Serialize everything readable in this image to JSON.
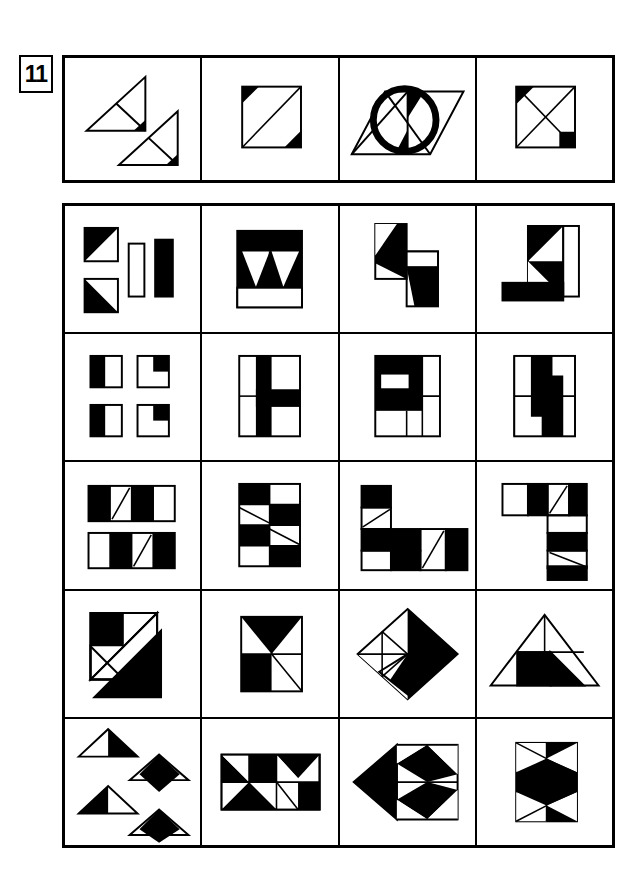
{
  "page": {
    "number_label": "11",
    "type": "visual-reasoning-worksheet",
    "ink_color": "#000000",
    "paper_color": "#ffffff"
  },
  "example_row": {
    "name": "example-figures-row",
    "cell_count": 4,
    "cells": [
      {
        "id": "ex-a",
        "description": "Two right triangles, each divided by an internal segment, with a small black triangle at the lower-right corner of each",
        "shapes": [
          "right-triangle",
          "right-triangle",
          "black-corner-triangle",
          "black-corner-triangle"
        ],
        "black_parts": 2
      },
      {
        "id": "ex-b",
        "description": "Square crossed by one diagonal, with small black triangles at the top-left and bottom-right corners",
        "shapes": [
          "square",
          "diagonal-line",
          "black-corner-triangle",
          "black-corner-triangle"
        ],
        "black_parts": 2
      },
      {
        "id": "ex-c",
        "description": "Parallelogram with internal diagonals overlaid by a thick circle outline, black triangles top-centre and bottom-centre",
        "shapes": [
          "parallelogram",
          "circle-outline",
          "black-triangle",
          "black-triangle"
        ],
        "black_parts": 2
      },
      {
        "id": "ex-d",
        "description": "Square with both diagonals forming an X, black triangle at the top-left corner and a black square at the bottom-right corner",
        "shapes": [
          "square",
          "x-diagonals",
          "black-corner-triangle",
          "black-corner-square"
        ],
        "black_parts": 2
      }
    ]
  },
  "answer_grid": {
    "name": "answer-figures-grid",
    "rows": 5,
    "columns": 4,
    "cells": [
      [
        {
          "id": "r1c1",
          "description": "Two squares each split by a diagonal with the lower-left half black, plus a tall white outlined rectangle and a solid black rectangle"
        },
        {
          "id": "r1c2",
          "description": "Black square containing two white triangles that form a V, with a white horizontal band across the bottom"
        },
        {
          "id": "r1c3",
          "description": "Two offset rectangles in an S arrangement, each half filled black along a diagonal"
        },
        {
          "id": "r1c4",
          "description": "Vertical rectangle with two black triangles stacked, a white bar on the right and a solid black bar along the bottom forming an L"
        }
      ],
      [
        {
          "id": "r2c1",
          "description": "Four small squares: the left pair have black left halves, the right pair have black upper-right quadrants"
        },
        {
          "id": "r2c2",
          "description": "Square divided into quarters with a black vertical bar and a black band extending right across the middle"
        },
        {
          "id": "r2c3",
          "description": "Square with a black C-shaped spiral occupying the top and left portions"
        },
        {
          "id": "r2c4",
          "description": "Square with a black S-shaped zigzag running from top to bottom"
        }
      ],
      [
        {
          "id": "r3c1",
          "description": "Two horizontal four-cell strips with alternating black and white cells and a diagonal line inside one white cell of each"
        },
        {
          "id": "r3c2",
          "description": "Three-by-three checkerboard of black and white cells with two thin diagonal lines"
        },
        {
          "id": "r3c3",
          "description": "Stepped strip of black and white cells arranged in an L, with diagonal lines in two white cells"
        },
        {
          "id": "r3c4",
          "description": "Seven-shaped arrangement of black and white cells with diagonal lines in two white cells"
        }
      ],
      [
        {
          "id": "r4c1",
          "description": "Large square containing a black square in the upper-left, a long white band across the diagonal and a large black triangle at the bottom"
        },
        {
          "id": "r4c2",
          "description": "Square split into four pinwheel sections with the top triangle and lower-left square black"
        },
        {
          "id": "r4c3",
          "description": "Diamond divided into quadrants with the upper-right and lower-left quadrants black"
        },
        {
          "id": "r4c4",
          "description": "Large triangle containing a black square and a black right triangle"
        }
      ],
      [
        {
          "id": "r5c1",
          "description": "Four separate triangles: two large ones half filled black and two with a black diamond sitting on top"
        },
        {
          "id": "r5c2",
          "description": "Horizontal rectangle made of black and white triangles and squares in a tangram pattern"
        },
        {
          "id": "r5c3",
          "description": "Left-pointing arrow of black triangles with two black diamonds on the right"
        },
        {
          "id": "r5c4",
          "description": "Square containing black triangles and a black diamond forming a bow-tie pattern"
        }
      ]
    ]
  }
}
